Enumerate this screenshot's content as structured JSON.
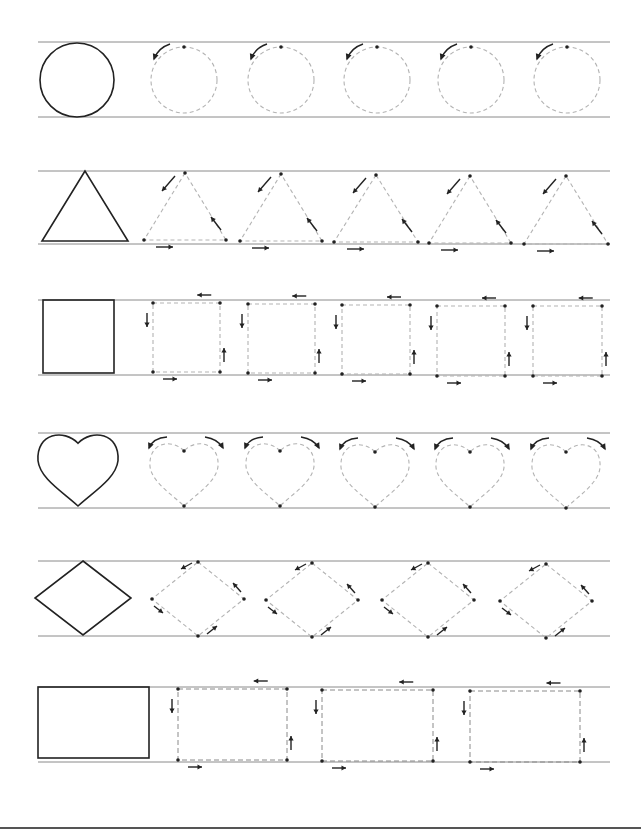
{
  "worksheet": {
    "title": "",
    "colors": {
      "guide": "#8a8a8a",
      "model": "#222222",
      "trace": "#b3b3b3"
    },
    "rows": [
      {
        "shape": "circle",
        "guides": [
          42,
          117
        ],
        "model": {
          "cx": 77,
          "cy": 80,
          "r": 37
        },
        "traces": [
          {
            "cx": 184,
            "cy": 80,
            "r": 33
          },
          {
            "cx": 281,
            "cy": 80,
            "r": 33
          },
          {
            "cx": 377,
            "cy": 80,
            "r": 33
          },
          {
            "cx": 471,
            "cy": 80,
            "r": 33
          },
          {
            "cx": 567,
            "cy": 80,
            "r": 33
          }
        ]
      },
      {
        "shape": "triangle",
        "guides": [
          171,
          244
        ],
        "model": {
          "x": 85,
          "top": 171,
          "bottom": 241,
          "half": 43
        },
        "traces": [
          {
            "x": 185,
            "top": 173,
            "bottom": 240,
            "half": 41
          },
          {
            "x": 281,
            "top": 174,
            "bottom": 241,
            "half": 41
          },
          {
            "x": 376,
            "top": 175,
            "bottom": 242,
            "half": 42
          },
          {
            "x": 470,
            "top": 176,
            "bottom": 243,
            "half": 41
          },
          {
            "x": 566,
            "top": 176,
            "bottom": 244,
            "half": 42
          }
        ]
      },
      {
        "shape": "square",
        "guides": [
          300,
          375
        ],
        "model": {
          "x": 43,
          "y": 300,
          "w": 71,
          "h": 73
        },
        "traces": [
          {
            "x": 153,
            "y": 303,
            "w": 67,
            "h": 69
          },
          {
            "x": 248,
            "y": 304,
            "w": 67,
            "h": 69
          },
          {
            "x": 342,
            "y": 305,
            "w": 68,
            "h": 69
          },
          {
            "x": 437,
            "y": 306,
            "w": 68,
            "h": 70
          },
          {
            "x": 533,
            "y": 306,
            "w": 69,
            "h": 70
          }
        ]
      },
      {
        "shape": "heart",
        "guides": [
          433,
          508
        ],
        "model": {
          "cx": 78,
          "top": 433,
          "bottom": 506,
          "w": 80
        },
        "traces": [
          {
            "cx": 184,
            "top": 442,
            "bottom": 506,
            "w": 68
          },
          {
            "cx": 280,
            "top": 442,
            "bottom": 506,
            "w": 68
          },
          {
            "cx": 375,
            "top": 443,
            "bottom": 507,
            "w": 68
          },
          {
            "cx": 470,
            "top": 443,
            "bottom": 507,
            "w": 68
          },
          {
            "cx": 566,
            "top": 443,
            "bottom": 508,
            "w": 68
          }
        ]
      },
      {
        "shape": "diamond",
        "guides": [
          561,
          636
        ],
        "model": {
          "cx": 83,
          "cy": 598,
          "hw": 48,
          "hh": 37
        },
        "traces": [
          {
            "cx": 198,
            "cy": 599,
            "hw": 46,
            "hh": 37
          },
          {
            "cx": 312,
            "cy": 600,
            "hw": 46,
            "hh": 37
          },
          {
            "cx": 428,
            "cy": 600,
            "hw": 46,
            "hh": 37
          },
          {
            "cx": 546,
            "cy": 601,
            "hw": 46,
            "hh": 37
          }
        ]
      },
      {
        "shape": "rectangle",
        "guides": [
          687,
          762
        ],
        "model": {
          "x": 38,
          "y": 687,
          "w": 111,
          "h": 71
        },
        "traces": [
          {
            "x": 178,
            "y": 689,
            "w": 109,
            "h": 71
          },
          {
            "x": 322,
            "y": 690,
            "w": 111,
            "h": 71
          },
          {
            "x": 470,
            "y": 691,
            "w": 110,
            "h": 71
          }
        ]
      }
    ]
  }
}
